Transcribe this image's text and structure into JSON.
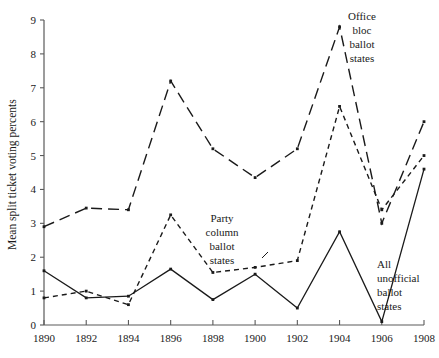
{
  "chart_data": {
    "type": "line",
    "title": "",
    "xlabel": "",
    "ylabel": "Mean split ticket voting percents",
    "x": [
      1890,
      1892,
      1894,
      1896,
      1898,
      1900,
      1902,
      1904,
      1906,
      1908
    ],
    "xticklabels": [
      "1890",
      "1892",
      "1894",
      "1896",
      "1898",
      "1900",
      "1902",
      "1904",
      "1906",
      "1908"
    ],
    "yticklabels": [
      "0",
      "1",
      "2",
      "3",
      "4",
      "5",
      "6",
      "7",
      "8",
      "9"
    ],
    "xlim": [
      1890,
      1908
    ],
    "ylim": [
      0,
      9
    ],
    "grid": false,
    "legend_position": "inline-annotations",
    "series": [
      {
        "name": "Office bloc ballot states",
        "style": "long-dashed",
        "values": [
          2.9,
          3.45,
          3.4,
          7.2,
          5.2,
          4.35,
          5.2,
          8.8,
          3.0,
          6.0
        ]
      },
      {
        "name": "Party column ballot states",
        "style": "short-dashed",
        "values": [
          0.8,
          1.0,
          0.6,
          3.25,
          1.55,
          1.7,
          1.9,
          6.45,
          3.4,
          5.0
        ]
      },
      {
        "name": "All unofficial ballot states",
        "style": "solid",
        "values": [
          1.6,
          0.8,
          0.85,
          1.65,
          0.75,
          1.5,
          0.5,
          2.75,
          0.1,
          4.6
        ]
      }
    ],
    "annotations": [
      {
        "name": "office-bloc-label",
        "text": "Office\nbloc\nballot\nstates",
        "lines": [
          "Office",
          "bloc",
          "ballot",
          "states"
        ]
      },
      {
        "name": "party-column-label",
        "text": "Party\ncolumn\nballot\nstates",
        "lines": [
          "Party",
          "column",
          "ballot",
          "states"
        ]
      },
      {
        "name": "all-unofficial-label",
        "text": "All\nunofficial\nballot\nstates",
        "lines": [
          "All",
          "unofficial",
          "ballot",
          "states"
        ]
      }
    ]
  },
  "labels": {
    "ylabel": "Mean split ticket voting percents",
    "annot_office": [
      "Office",
      "bloc",
      "ballot",
      "states"
    ],
    "annot_party": [
      "Party",
      "column",
      "ballot",
      "states"
    ],
    "annot_unofficial": [
      "All",
      "unofficial",
      "ballot",
      "states"
    ]
  },
  "colors": {
    "ink": "#1a1a1a",
    "axis": "#5a5a5a",
    "background": "#ffffff"
  }
}
